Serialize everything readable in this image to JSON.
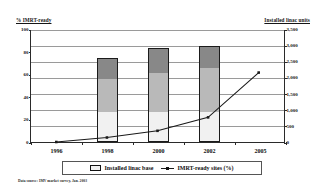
{
  "chart_data": {
    "type": "bar",
    "title": "",
    "subtitle": "",
    "xlabel": "",
    "ylabel": "% IMRT-ready",
    "ylabel_secondary": "Installed linac units",
    "categories": [
      "1996",
      "1998",
      "2000",
      "2002",
      "2005"
    ],
    "ylim": [
      0,
      100
    ],
    "ylim_secondary": [
      0,
      3500
    ],
    "yticks": [
      0,
      20,
      40,
      60,
      80,
      100
    ],
    "ytick_labels": [
      "0",
      "20",
      "40",
      "60",
      "80",
      "100"
    ],
    "yticks_secondary": [
      0,
      500,
      1000,
      1500,
      2000,
      2500,
      3000,
      3500
    ],
    "ytick_labels_secondary": [
      "0",
      "500",
      "1,000",
      "1,500",
      "2,000",
      "2,500",
      "3,000",
      "3,500"
    ],
    "grid": true,
    "legend_position": "bottom",
    "series": [
      {
        "name": "Installed linac base",
        "type": "bar",
        "stacked": true,
        "axis": "right",
        "segments": [
          {
            "name": "segment-lower",
            "color": "#f1f1f1",
            "values": [
              0,
              900,
              900,
              900,
              0
            ]
          },
          {
            "name": "segment-middle",
            "color": "#b9b9b9",
            "values": [
              0,
              1050,
              1250,
              1400,
              0
            ]
          },
          {
            "name": "segment-upper",
            "color": "#888888",
            "values": [
              0,
              650,
              750,
              650,
              0
            ]
          }
        ],
        "totals": [
          0,
          2600,
          2900,
          2950,
          0
        ]
      },
      {
        "name": "IMRT-ready sites (%)",
        "type": "line",
        "axis": "left",
        "color": "#1a1a1a",
        "values": [
          0,
          4,
          10,
          22,
          62
        ]
      }
    ],
    "annotations": {
      "footnote": "Data source: IMV market survey, Jan. 2003"
    }
  },
  "legend": {
    "items": [
      {
        "label": "Installed linac base",
        "marker": "box-swatch"
      },
      {
        "label": "IMRT-ready sites (%)",
        "marker": "line-marker"
      }
    ]
  },
  "colors": {
    "axis": "#2a2a2a",
    "grid": "#9a9a9a",
    "line": "#1a1a1a",
    "bar_border": "#1b1b1b",
    "bar_lower": "#f1f1f1",
    "bar_middle": "#b9b9b9",
    "bar_upper": "#888888",
    "background": "#ffffff"
  }
}
